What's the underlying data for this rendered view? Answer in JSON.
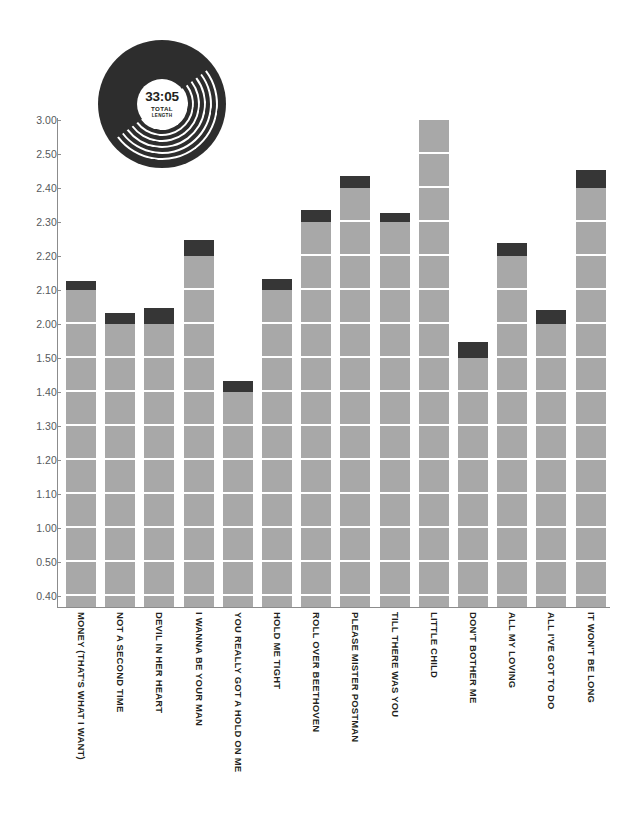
{
  "record_badge": {
    "time": "33:05",
    "caption_line1": "TOTAL",
    "caption_line2": "LENGTH"
  },
  "colors": {
    "bar_body": "#a8a8a8",
    "bar_cap": "#363636",
    "axis": "#8c8c8c",
    "tick_label": "#56595c",
    "track_label": "#231f20",
    "background": "#ffffff"
  },
  "chart_data": {
    "type": "bar",
    "title": "",
    "subtitle": "",
    "xlabel": "",
    "ylabel": "",
    "grid": true,
    "legend": "none",
    "y_tick_labels": [
      "3.00",
      "2.50",
      "2.40",
      "2.30",
      "2.20",
      "2.10",
      "2.00",
      "1.50",
      "1.40",
      "1.30",
      "1.20",
      "1.10",
      "1.00",
      "0.50",
      "0.40"
    ],
    "axis_note": "evenly-spaced ordinal ticks (minutes.seconds), bottom of plot below 0.40",
    "categories": [
      "MONEY (THAT'S WHAT I WANT)",
      "NOT A SECOND TIME",
      "DEVIL IN HER HEART",
      "I WANNA BE YOUR MAN",
      "YOU REALLY GOT A HOLD ON ME",
      "HOLD ME TIGHT",
      "ROLL OVER BEETHOVEN",
      "PLEASE MISTER POSTMAN",
      "TILL THERE WAS YOU",
      "LITTLE CHILD",
      "DON'T BOTHER ME",
      "ALL MY LOVING",
      "ALL I'VE GOT TO DO",
      "IT WON'T BE LONG"
    ],
    "values": [
      2.12,
      2.03,
      2.08,
      2.28,
      1.43,
      2.13,
      2.34,
      2.44,
      2.31,
      3.0,
      1.58,
      2.25,
      2.06,
      2.49
    ],
    "value_labels": [
      "2:12",
      "2:03",
      "2:08",
      "2:28",
      "1:43",
      "2:13",
      "2:34",
      "2:44",
      "2:31",
      "3:00",
      "1:58",
      "2:25",
      "2:06",
      "2:49"
    ],
    "base_tick": [
      "2.10",
      "2.00",
      "2.00",
      "2.20",
      "1.40",
      "2.10",
      "2.30",
      "2.40",
      "2.30",
      "3.00",
      "1.50",
      "2.20",
      "2.00",
      "2.40"
    ],
    "ylim": [
      0.0,
      3.0
    ]
  }
}
